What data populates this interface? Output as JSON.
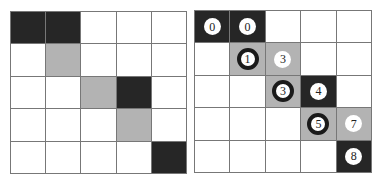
{
  "colors": {
    "white": "#ffffff",
    "gray": "#b3b3b3",
    "dark": "#262626",
    "ring": "#1a1a1a",
    "line": "#777777"
  },
  "left_grid": {
    "rows": [
      [
        "dark",
        "dark",
        "white",
        "white",
        "white"
      ],
      [
        "white",
        "gray",
        "white",
        "white",
        "white"
      ],
      [
        "white",
        "white",
        "gray",
        "dark",
        "white"
      ],
      [
        "white",
        "white",
        "white",
        "gray",
        "white"
      ],
      [
        "white",
        "white",
        "white",
        "white",
        "dark"
      ]
    ]
  },
  "right_grid": {
    "rows": [
      [
        "dark",
        "dark",
        "white",
        "white",
        "white"
      ],
      [
        "white",
        "gray",
        "gray",
        "white",
        "white"
      ],
      [
        "white",
        "white",
        "gray",
        "dark",
        "white"
      ],
      [
        "white",
        "white",
        "white",
        "gray",
        "gray"
      ],
      [
        "white",
        "white",
        "white",
        "white",
        "dark"
      ]
    ],
    "labels": [
      {
        "row": 0,
        "col": 0,
        "text": "0",
        "ring": false
      },
      {
        "row": 0,
        "col": 1,
        "text": "0",
        "ring": false
      },
      {
        "row": 1,
        "col": 1,
        "text": "1",
        "ring": true
      },
      {
        "row": 1,
        "col": 2,
        "text": "3",
        "ring": false
      },
      {
        "row": 2,
        "col": 2,
        "text": "3",
        "ring": true
      },
      {
        "row": 2,
        "col": 3,
        "text": "4",
        "ring": false
      },
      {
        "row": 3,
        "col": 3,
        "text": "5",
        "ring": true
      },
      {
        "row": 3,
        "col": 4,
        "text": "7",
        "ring": false
      },
      {
        "row": 4,
        "col": 4,
        "text": "8",
        "ring": false
      }
    ]
  }
}
